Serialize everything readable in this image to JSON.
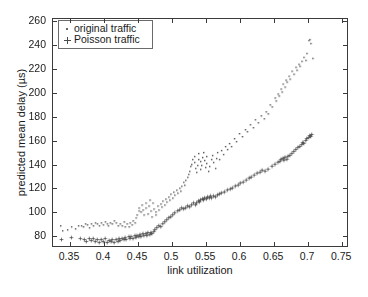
{
  "chart_data": {
    "type": "scatter",
    "title": "",
    "xlabel": "link utilization",
    "ylabel": "predicted mean delay (µs)",
    "xlim": [
      0.325,
      0.76
    ],
    "ylim": [
      70,
      262
    ],
    "xticks": [
      "0.35",
      "0.4",
      "0.45",
      "0.5",
      "0.55",
      "0.6",
      "0.65",
      "0.7",
      "0.75"
    ],
    "xtick_values": [
      0.35,
      0.4,
      0.45,
      0.5,
      0.55,
      0.6,
      0.65,
      0.7,
      0.75
    ],
    "yticks": [
      "80",
      "100",
      "120",
      "140",
      "160",
      "180",
      "200",
      "220",
      "240",
      "260"
    ],
    "ytick_values": [
      80,
      100,
      120,
      140,
      160,
      180,
      200,
      220,
      240,
      260
    ],
    "grid": false,
    "legend_position": "upper left",
    "marker_color": "#4a4a4a",
    "axis_color": "#3b3b3b",
    "background": "#ffffff",
    "series": [
      {
        "name": "original traffic",
        "marker": "dot",
        "points": [
          [
            0.336,
            88.0
          ],
          [
            0.338,
            83.5
          ],
          [
            0.345,
            84.0
          ],
          [
            0.352,
            86.5
          ],
          [
            0.358,
            85.0
          ],
          [
            0.362,
            87.5
          ],
          [
            0.366,
            88.0
          ],
          [
            0.369,
            87.0
          ],
          [
            0.372,
            89.0
          ],
          [
            0.375,
            88.5
          ],
          [
            0.378,
            86.0
          ],
          [
            0.381,
            89.5
          ],
          [
            0.384,
            88.0
          ],
          [
            0.387,
            90.5
          ],
          [
            0.39,
            89.0
          ],
          [
            0.392,
            87.5
          ],
          [
            0.395,
            90.0
          ],
          [
            0.398,
            88.5
          ],
          [
            0.401,
            91.0
          ],
          [
            0.404,
            89.5
          ],
          [
            0.406,
            88.0
          ],
          [
            0.409,
            90.5
          ],
          [
            0.412,
            89.0
          ],
          [
            0.415,
            91.5
          ],
          [
            0.418,
            90.0
          ],
          [
            0.42,
            87.5
          ],
          [
            0.423,
            89.5
          ],
          [
            0.426,
            88.0
          ],
          [
            0.429,
            91.0
          ],
          [
            0.431,
            86.5
          ],
          [
            0.434,
            89.0
          ],
          [
            0.436,
            87.0
          ],
          [
            0.438,
            90.5
          ],
          [
            0.441,
            88.5
          ],
          [
            0.443,
            92.0
          ],
          [
            0.445,
            90.0
          ],
          [
            0.447,
            94.5
          ],
          [
            0.449,
            97.0
          ],
          [
            0.451,
            100.5
          ],
          [
            0.452,
            103.0
          ],
          [
            0.454,
            99.0
          ],
          [
            0.456,
            105.5
          ],
          [
            0.457,
            101.0
          ],
          [
            0.459,
            96.5
          ],
          [
            0.461,
            107.0
          ],
          [
            0.462,
            102.5
          ],
          [
            0.464,
            98.0
          ],
          [
            0.466,
            104.0
          ],
          [
            0.467,
            109.0
          ],
          [
            0.469,
            100.0
          ],
          [
            0.471,
            95.5
          ],
          [
            0.472,
            106.5
          ],
          [
            0.474,
            102.0
          ],
          [
            0.476,
            97.0
          ],
          [
            0.477,
            99.5
          ],
          [
            0.479,
            104.5
          ],
          [
            0.481,
            101.0
          ],
          [
            0.483,
            106.0
          ],
          [
            0.485,
            103.5
          ],
          [
            0.487,
            108.5
          ],
          [
            0.489,
            105.0
          ],
          [
            0.491,
            110.0
          ],
          [
            0.493,
            107.5
          ],
          [
            0.495,
            112.0
          ],
          [
            0.497,
            109.0
          ],
          [
            0.499,
            114.5
          ],
          [
            0.501,
            111.0
          ],
          [
            0.503,
            116.0
          ],
          [
            0.505,
            113.5
          ],
          [
            0.507,
            118.0
          ],
          [
            0.509,
            115.0
          ],
          [
            0.511,
            119.5
          ],
          [
            0.513,
            117.0
          ],
          [
            0.515,
            121.0
          ],
          [
            0.517,
            124.5
          ],
          [
            0.519,
            122.0
          ],
          [
            0.521,
            126.0
          ],
          [
            0.523,
            128.5
          ],
          [
            0.525,
            131.0
          ],
          [
            0.527,
            134.0
          ],
          [
            0.528,
            137.5
          ],
          [
            0.53,
            140.0
          ],
          [
            0.531,
            143.5
          ],
          [
            0.533,
            146.0
          ],
          [
            0.534,
            141.0
          ],
          [
            0.535,
            136.0
          ],
          [
            0.536,
            133.0
          ],
          [
            0.538,
            138.5
          ],
          [
            0.539,
            144.0
          ],
          [
            0.54,
            148.5
          ],
          [
            0.542,
            142.0
          ],
          [
            0.543,
            135.5
          ],
          [
            0.544,
            139.0
          ],
          [
            0.546,
            145.5
          ],
          [
            0.547,
            150.0
          ],
          [
            0.548,
            143.0
          ],
          [
            0.55,
            137.0
          ],
          [
            0.551,
            140.5
          ],
          [
            0.552,
            146.0
          ],
          [
            0.554,
            134.0
          ],
          [
            0.556,
            138.0
          ],
          [
            0.558,
            143.5
          ],
          [
            0.56,
            147.0
          ],
          [
            0.562,
            141.0
          ],
          [
            0.564,
            136.5
          ],
          [
            0.566,
            145.0
          ],
          [
            0.568,
            149.5
          ],
          [
            0.57,
            144.0
          ],
          [
            0.573,
            151.0
          ],
          [
            0.576,
            148.0
          ],
          [
            0.579,
            154.5
          ],
          [
            0.582,
            152.0
          ],
          [
            0.585,
            157.5
          ],
          [
            0.588,
            155.0
          ],
          [
            0.592,
            161.0
          ],
          [
            0.596,
            159.0
          ],
          [
            0.6,
            165.5
          ],
          [
            0.604,
            163.0
          ],
          [
            0.608,
            169.0
          ],
          [
            0.612,
            167.5
          ],
          [
            0.616,
            173.0
          ],
          [
            0.62,
            171.0
          ],
          [
            0.624,
            177.5
          ],
          [
            0.628,
            175.0
          ],
          [
            0.632,
            180.5
          ],
          [
            0.636,
            178.0
          ],
          [
            0.64,
            184.0
          ],
          [
            0.643,
            182.5
          ],
          [
            0.646,
            190.0
          ],
          [
            0.649,
            188.0
          ],
          [
            0.652,
            195.5
          ],
          [
            0.654,
            193.0
          ],
          [
            0.657,
            199.0
          ],
          [
            0.659,
            197.5
          ],
          [
            0.661,
            203.0
          ],
          [
            0.663,
            201.0
          ],
          [
            0.665,
            207.5
          ],
          [
            0.667,
            205.0
          ],
          [
            0.669,
            211.0
          ],
          [
            0.671,
            209.0
          ],
          [
            0.673,
            214.5
          ],
          [
            0.675,
            212.0
          ],
          [
            0.678,
            218.0
          ],
          [
            0.68,
            216.0
          ],
          [
            0.683,
            221.5
          ],
          [
            0.685,
            219.0
          ],
          [
            0.688,
            224.0
          ],
          [
            0.69,
            222.5
          ],
          [
            0.693,
            227.0
          ],
          [
            0.695,
            230.0
          ],
          [
            0.698,
            228.0
          ],
          [
            0.7,
            233.5
          ],
          [
            0.702,
            244.0
          ],
          [
            0.704,
            245.5
          ],
          [
            0.706,
            242.0
          ],
          [
            0.708,
            229.5
          ]
        ]
      },
      {
        "name": "Poisson traffic",
        "marker": "plus",
        "points": [
          [
            0.337,
            76.0
          ],
          [
            0.352,
            77.5
          ],
          [
            0.365,
            77.0
          ],
          [
            0.37,
            75.5
          ],
          [
            0.374,
            74.5
          ],
          [
            0.378,
            76.5
          ],
          [
            0.381,
            75.0
          ],
          [
            0.384,
            77.0
          ],
          [
            0.387,
            74.0
          ],
          [
            0.39,
            76.0
          ],
          [
            0.393,
            73.5
          ],
          [
            0.396,
            75.5
          ],
          [
            0.399,
            74.5
          ],
          [
            0.402,
            76.5
          ],
          [
            0.405,
            73.0
          ],
          [
            0.407,
            75.0
          ],
          [
            0.41,
            74.0
          ],
          [
            0.412,
            76.0
          ],
          [
            0.415,
            73.5
          ],
          [
            0.417,
            75.5
          ],
          [
            0.42,
            74.5
          ],
          [
            0.422,
            76.5
          ],
          [
            0.424,
            75.0
          ],
          [
            0.427,
            77.0
          ],
          [
            0.429,
            75.5
          ],
          [
            0.431,
            77.5
          ],
          [
            0.433,
            76.0
          ],
          [
            0.436,
            78.0
          ],
          [
            0.438,
            76.5
          ],
          [
            0.44,
            78.5
          ],
          [
            0.443,
            77.0
          ],
          [
            0.445,
            79.0
          ],
          [
            0.447,
            77.5
          ],
          [
            0.449,
            79.5
          ],
          [
            0.451,
            78.0
          ],
          [
            0.453,
            80.0
          ],
          [
            0.455,
            78.5
          ],
          [
            0.457,
            80.5
          ],
          [
            0.459,
            79.0
          ],
          [
            0.461,
            81.0
          ],
          [
            0.463,
            79.5
          ],
          [
            0.465,
            81.5
          ],
          [
            0.467,
            80.0
          ],
          [
            0.469,
            82.0
          ],
          [
            0.471,
            80.5
          ],
          [
            0.473,
            82.5
          ],
          [
            0.475,
            84.0
          ],
          [
            0.478,
            86.0
          ],
          [
            0.481,
            88.0
          ],
          [
            0.484,
            87.0
          ],
          [
            0.487,
            89.5
          ],
          [
            0.49,
            91.0
          ],
          [
            0.493,
            92.5
          ],
          [
            0.496,
            94.0
          ],
          [
            0.499,
            95.5
          ],
          [
            0.502,
            97.0
          ],
          [
            0.505,
            98.5
          ],
          [
            0.508,
            100.0
          ],
          [
            0.511,
            101.0
          ],
          [
            0.514,
            102.5
          ],
          [
            0.517,
            101.5
          ],
          [
            0.52,
            103.0
          ],
          [
            0.523,
            104.5
          ],
          [
            0.526,
            103.5
          ],
          [
            0.529,
            105.0
          ],
          [
            0.532,
            106.5
          ],
          [
            0.535,
            105.5
          ],
          [
            0.537,
            107.0
          ],
          [
            0.539,
            108.5
          ],
          [
            0.541,
            107.5
          ],
          [
            0.543,
            109.0
          ],
          [
            0.545,
            110.5
          ],
          [
            0.547,
            109.5
          ],
          [
            0.549,
            111.0
          ],
          [
            0.551,
            110.0
          ],
          [
            0.553,
            112.0
          ],
          [
            0.555,
            111.0
          ],
          [
            0.557,
            112.5
          ],
          [
            0.559,
            111.5
          ],
          [
            0.561,
            113.0
          ],
          [
            0.564,
            112.0
          ],
          [
            0.567,
            113.5
          ],
          [
            0.57,
            114.5
          ],
          [
            0.574,
            115.5
          ],
          [
            0.578,
            116.5
          ],
          [
            0.582,
            117.5
          ],
          [
            0.586,
            118.5
          ],
          [
            0.59,
            119.5
          ],
          [
            0.594,
            121.0
          ],
          [
            0.598,
            122.0
          ],
          [
            0.602,
            123.5
          ],
          [
            0.606,
            124.5
          ],
          [
            0.61,
            126.0
          ],
          [
            0.614,
            127.5
          ],
          [
            0.618,
            129.0
          ],
          [
            0.622,
            130.5
          ],
          [
            0.626,
            132.0
          ],
          [
            0.63,
            133.0
          ],
          [
            0.634,
            134.5
          ],
          [
            0.638,
            134.0
          ],
          [
            0.642,
            135.0
          ],
          [
            0.648,
            137.5
          ],
          [
            0.653,
            139.5
          ],
          [
            0.657,
            141.0
          ],
          [
            0.66,
            142.5
          ],
          [
            0.662,
            143.5
          ],
          [
            0.664,
            144.5
          ],
          [
            0.666,
            143.0
          ],
          [
            0.668,
            145.5
          ],
          [
            0.67,
            144.0
          ],
          [
            0.672,
            146.5
          ],
          [
            0.675,
            147.5
          ],
          [
            0.678,
            149.0
          ],
          [
            0.681,
            150.5
          ],
          [
            0.684,
            152.0
          ],
          [
            0.687,
            153.5
          ],
          [
            0.69,
            155.0
          ],
          [
            0.692,
            156.5
          ],
          [
            0.694,
            158.0
          ],
          [
            0.696,
            157.0
          ],
          [
            0.698,
            159.5
          ],
          [
            0.7,
            161.0
          ],
          [
            0.702,
            162.5
          ],
          [
            0.704,
            164.0
          ],
          [
            0.706,
            163.0
          ],
          [
            0.707,
            165.0
          ]
        ]
      }
    ]
  },
  "legend": {
    "items": [
      {
        "label": "original traffic",
        "marker": "dot"
      },
      {
        "label": "Poisson traffic",
        "marker": "plus"
      }
    ]
  }
}
